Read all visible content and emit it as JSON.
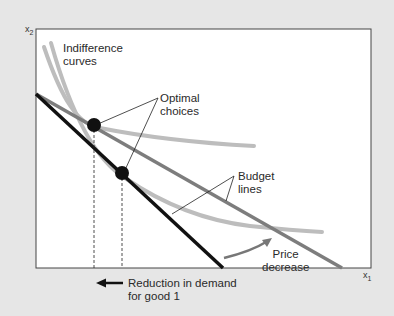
{
  "diagram": {
    "axes": {
      "y_label": "x",
      "y_label_sub": "2",
      "x_label": "x",
      "x_label_sub": "1"
    },
    "labels": {
      "indifference_line1": "Indifference",
      "indifference_line2": "curves",
      "optimal_line1": "Optimal",
      "optimal_line2": "choices",
      "budget_line1": "Budget",
      "budget_line2": "lines",
      "price_line1": "Price",
      "price_line2": "decrease",
      "reduction_line1": "Reduction in demand",
      "reduction_line2": "for good 1"
    },
    "colors": {
      "background": "#e6e6e6",
      "panel": "#ffffff",
      "original_budget_line": "#111111",
      "new_budget_line": "#7d7d7d",
      "indifference_curve": "#bdbdbd",
      "optimal_point": "#111111",
      "arrow": "#777777"
    },
    "elements": {
      "indifference_curves": 2,
      "budget_lines": 2,
      "optimal_points": 2
    }
  }
}
